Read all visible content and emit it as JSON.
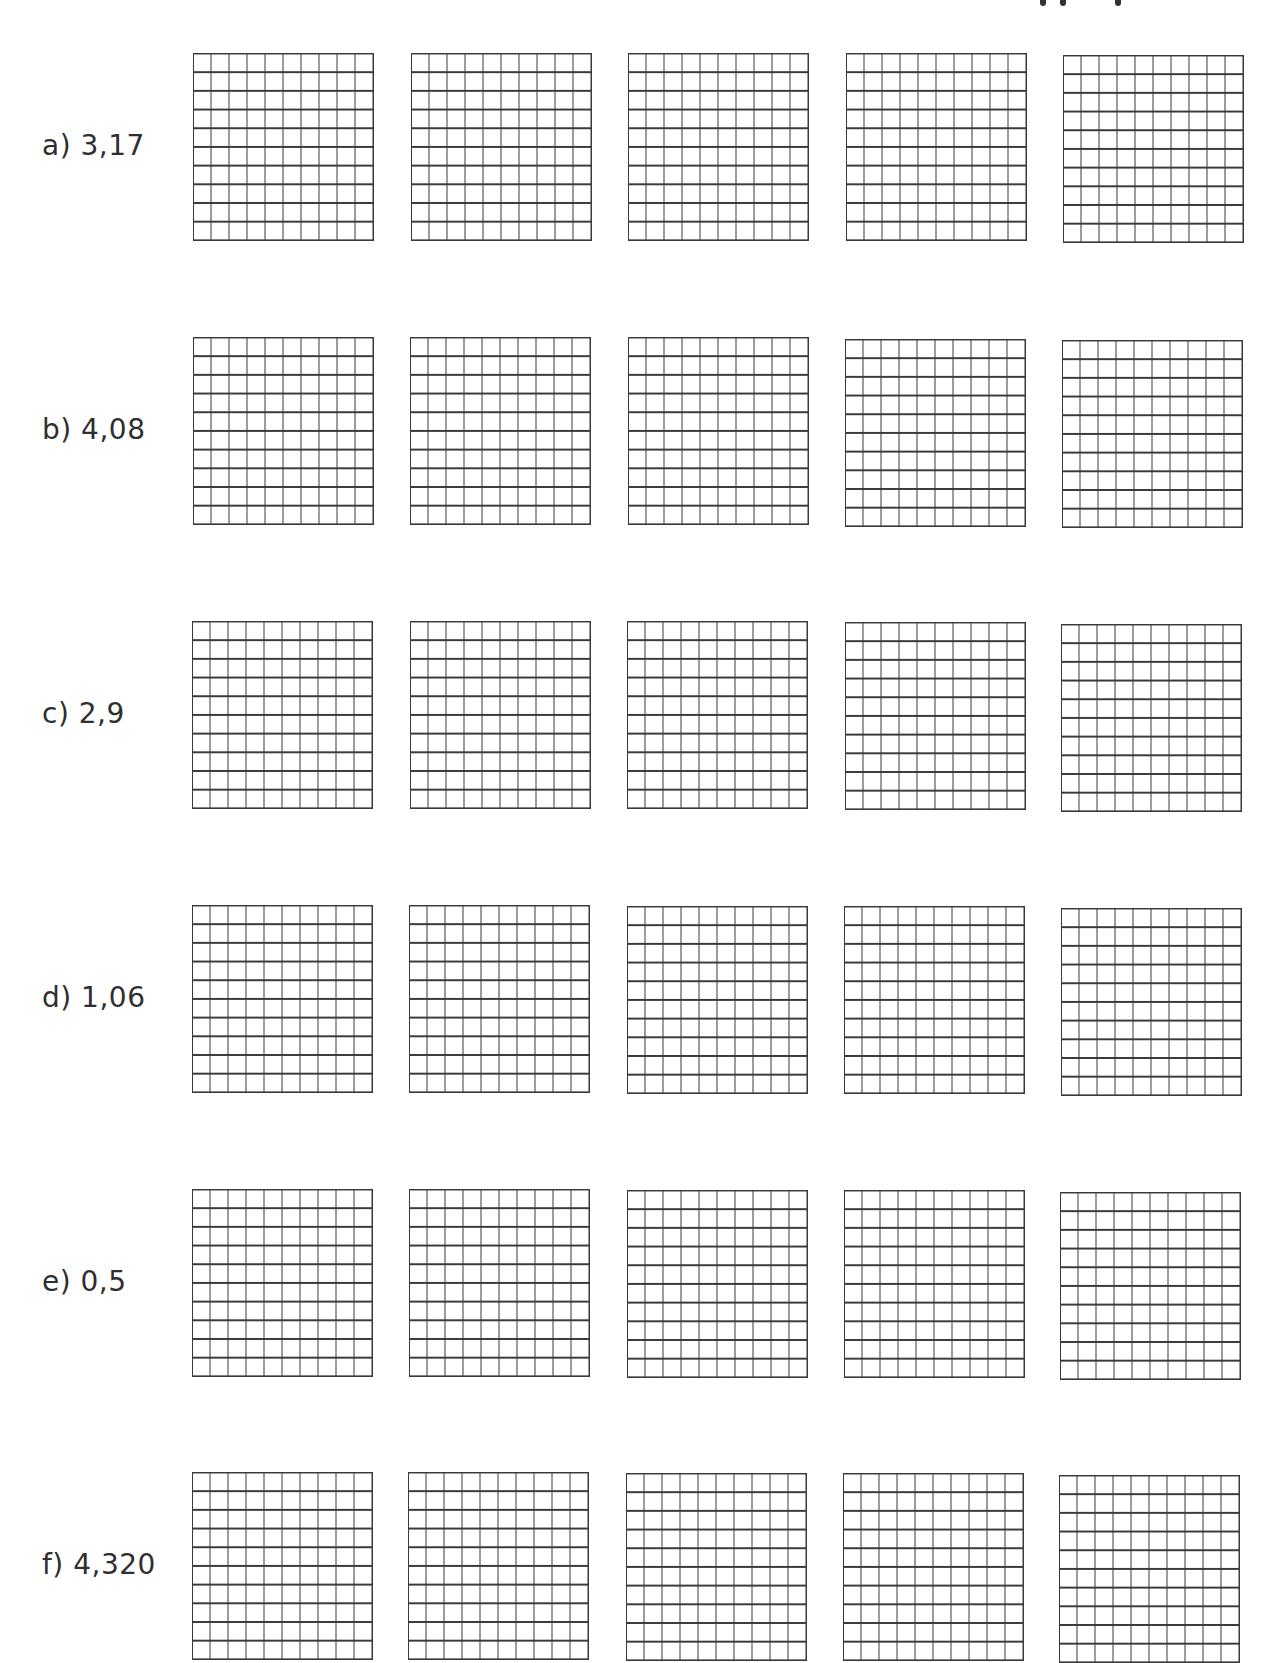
{
  "worksheet": {
    "grid_spec": {
      "rows": 10,
      "columns": 10,
      "grids_per_item": 5
    },
    "items": [
      {
        "label": "a) 3,17"
      },
      {
        "label": "b) 4,08"
      },
      {
        "label": "c) 2,9"
      },
      {
        "label": "d) 1,06"
      },
      {
        "label": "e) 0,5"
      },
      {
        "label": "f) 4,320"
      }
    ]
  },
  "colors": {
    "ink": "#3a3a3a",
    "background": "#ffffff"
  }
}
